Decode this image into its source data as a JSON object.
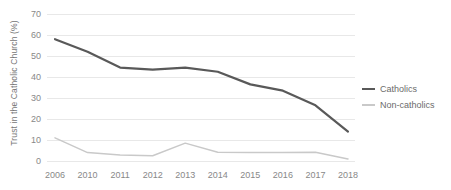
{
  "chart_data": {
    "type": "line",
    "title": "",
    "xlabel": "",
    "ylabel": "Trust in the Catholic Church (%)",
    "categories": [
      "2006",
      "2010",
      "2011",
      "2012",
      "2013",
      "2014",
      "2015",
      "2016",
      "2017",
      "2018"
    ],
    "ylim": [
      0,
      70
    ],
    "ytick_step": 10,
    "yticks": [
      "0",
      "10",
      "20",
      "30",
      "40",
      "50",
      "60",
      "70"
    ],
    "grid": "horizontal",
    "legend_position": "right",
    "series": [
      {
        "name": "Catholics",
        "color": "#595959",
        "line_width": 2.2,
        "values": [
          58,
          52,
          44.5,
          43.5,
          44.5,
          42.5,
          36.5,
          33.5,
          26.5,
          14
        ]
      },
      {
        "name": "Non-catholics",
        "color": "#c9c9c9",
        "line_width": 1.5,
        "values": [
          11,
          4,
          2.8,
          2.5,
          8.5,
          4.2,
          4,
          4,
          4.2,
          1
        ]
      }
    ]
  },
  "legend": {
    "items": [
      {
        "label": "Catholics"
      },
      {
        "label": "Non-catholics"
      }
    ]
  },
  "colors": {
    "gridline": "#e8e8e8",
    "tick_text": "#888888",
    "axis_title_text": "#767676",
    "background": "#ffffff"
  }
}
